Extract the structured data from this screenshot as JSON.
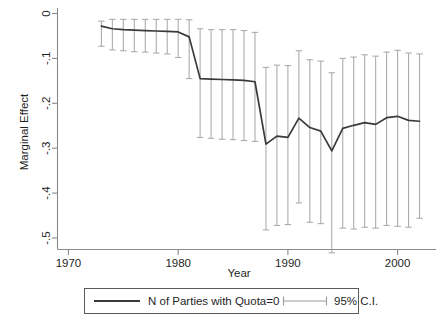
{
  "chart_data": {
    "type": "line",
    "title": "",
    "subtitle": "",
    "xlabel": "Year",
    "ylabel": "Marginal Effect",
    "xlim": [
      1969.0,
      1003.0
    ],
    "x_axis_range": [
      1969.0,
      2003.5
    ],
    "ylim": [
      -0.555,
      0.022
    ],
    "grid": false,
    "legend_position": "below-axis-centered",
    "y_ticks": [
      0,
      -0.1,
      -0.2,
      -0.3,
      -0.4,
      -0.5
    ],
    "y_tick_labels": [
      "0",
      "-.1",
      "-.2",
      "-.3",
      "-.4",
      "-.5"
    ],
    "x_ticks": [
      1970,
      1980,
      1990,
      2000
    ],
    "x_tick_labels": [
      "1970",
      "1980",
      "1990",
      "2000"
    ],
    "series": [
      {
        "name": "N of Parties with Quota=0",
        "style": "line",
        "color": "#3a3a3a",
        "x": [
          1973,
          1974,
          1975,
          1976,
          1977,
          1978,
          1979,
          1980,
          1981,
          1982,
          1983,
          1984,
          1985,
          1986,
          1987,
          1988,
          1989,
          1990,
          1991,
          1992,
          1993,
          1994,
          1995,
          1996,
          1997,
          1998,
          1999,
          2000,
          2001,
          2002
        ],
        "values": [
          -0.028,
          -0.034,
          -0.036,
          -0.037,
          -0.038,
          -0.039,
          -0.04,
          -0.041,
          -0.052,
          -0.145,
          -0.146,
          -0.147,
          -0.148,
          -0.149,
          -0.152,
          -0.291,
          -0.273,
          -0.276,
          -0.233,
          -0.254,
          -0.262,
          -0.306,
          -0.256,
          -0.249,
          -0.243,
          -0.247,
          -0.232,
          -0.229,
          -0.238,
          -0.24
        ]
      },
      {
        "name": "95% C.I.",
        "style": "errorbar",
        "color": "#a8a8a8",
        "x": [
          1973,
          1974,
          1975,
          1976,
          1977,
          1978,
          1979,
          1980,
          1981,
          1982,
          1983,
          1984,
          1985,
          1986,
          1987,
          1988,
          1989,
          1990,
          1991,
          1992,
          1993,
          1994,
          1995,
          1996,
          1997,
          1998,
          1999,
          2000,
          2001,
          2002
        ],
        "lower": [
          -0.073,
          -0.081,
          -0.083,
          -0.085,
          -0.086,
          -0.088,
          -0.09,
          -0.098,
          -0.145,
          -0.276,
          -0.278,
          -0.28,
          -0.281,
          -0.283,
          -0.285,
          -0.482,
          -0.472,
          -0.47,
          -0.422,
          -0.465,
          -0.468,
          -0.533,
          -0.478,
          -0.48,
          -0.476,
          -0.478,
          -0.472,
          -0.474,
          -0.476,
          -0.456
        ],
        "upper": [
          -0.017,
          -0.013,
          -0.013,
          -0.013,
          -0.013,
          -0.013,
          -0.013,
          -0.013,
          -0.014,
          -0.034,
          -0.036,
          -0.036,
          -0.036,
          -0.038,
          -0.042,
          -0.12,
          -0.115,
          -0.116,
          -0.083,
          -0.103,
          -0.106,
          -0.132,
          -0.1,
          -0.097,
          -0.092,
          -0.095,
          -0.086,
          -0.082,
          -0.088,
          -0.09
        ]
      }
    ]
  },
  "legend": {
    "entries": [
      {
        "label": "N of Parties with Quota=0",
        "marker": "solid-line"
      },
      {
        "label": "95% C.I.",
        "marker": "error-bar"
      }
    ]
  },
  "colors": {
    "series_line": "#3a3a3a",
    "ci_bar": "#a8a8a8",
    "axis": "#8a8a8a",
    "text": "#1f1f1f",
    "background": "#ffffff"
  }
}
